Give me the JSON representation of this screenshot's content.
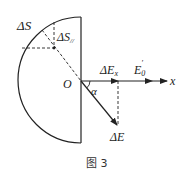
{
  "figure": {
    "caption": "图 3",
    "labels": {
      "delta_s": "ΔS",
      "delta_s_parallel_main": "ΔS",
      "delta_s_parallel_sub": "//",
      "origin": "O",
      "alpha": "α",
      "delta_ex_main": "ΔE",
      "delta_ex_sub": "x",
      "e0_main": "E",
      "e0_sub": "0",
      "e0_sup": "′",
      "x_axis": "x",
      "delta_e": "ΔE"
    },
    "colors": {
      "stroke": "#222222"
    }
  }
}
